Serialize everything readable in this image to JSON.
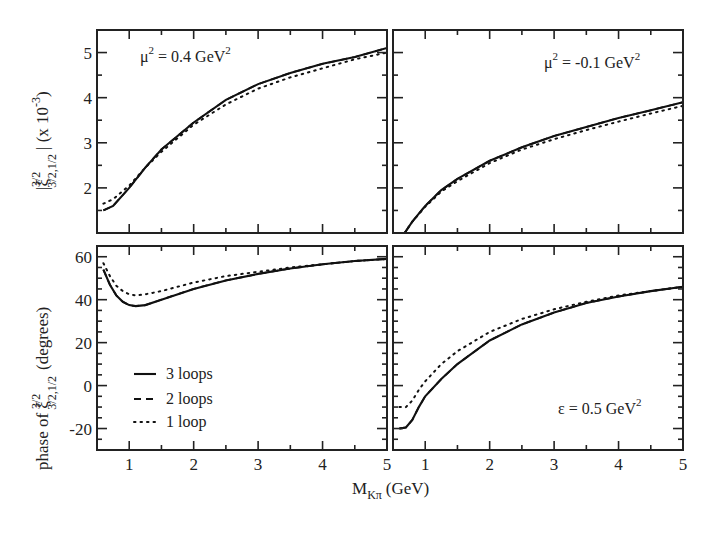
{
  "chart_data": {
    "type": "line",
    "xlabel": "M_Kπ (GeV)",
    "shared_x_ticks": [
      1,
      2,
      3,
      4,
      5
    ],
    "xlim": [
      0.5,
      5.0
    ],
    "legend": {
      "position": "lower-left of bottom-left panel",
      "entries": [
        "3 loops",
        "2 loops",
        "1 loop"
      ],
      "styles": [
        "solid",
        "dashed",
        "dotted"
      ]
    },
    "panels": [
      {
        "id": "top-left",
        "annotation": "μ² = 0.4 GeV²",
        "ylabel": "|ξ^{3/2}_{3/2,1/2}|  (x 10^-3)",
        "ylim": [
          1.0,
          5.5
        ],
        "y_ticks": [
          2,
          3,
          4,
          5
        ],
        "series": [
          {
            "name": "3 loops",
            "x": [
              0.6,
              0.75,
              1.0,
              1.25,
              1.5,
              2.0,
              2.5,
              3.0,
              3.5,
              4.0,
              4.5,
              5.0
            ],
            "values": [
              1.5,
              1.6,
              2.0,
              2.45,
              2.85,
              3.45,
              3.95,
              4.3,
              4.55,
              4.75,
              4.9,
              5.1
            ]
          },
          {
            "name": "2 loops",
            "x": [
              0.6,
              0.75,
              1.0,
              1.25,
              1.5,
              2.0,
              2.5,
              3.0,
              3.5,
              4.0,
              4.5,
              5.0
            ],
            "values": [
              1.5,
              1.6,
              2.0,
              2.45,
              2.85,
              3.45,
              3.95,
              4.3,
              4.55,
              4.75,
              4.9,
              5.1
            ]
          },
          {
            "name": "1 loop",
            "x": [
              0.6,
              0.75,
              1.0,
              1.25,
              1.5,
              2.0,
              2.5,
              3.0,
              3.5,
              4.0,
              4.5,
              5.0
            ],
            "values": [
              1.65,
              1.75,
              2.05,
              2.45,
              2.8,
              3.4,
              3.85,
              4.2,
              4.45,
              4.65,
              4.85,
              5.0
            ]
          }
        ]
      },
      {
        "id": "top-right",
        "annotation": "μ² = -0.1 GeV²",
        "ylim": [
          1.0,
          5.5
        ],
        "y_ticks": [
          2,
          3,
          4,
          5
        ],
        "series": [
          {
            "name": "3 loops",
            "x": [
              0.68,
              0.8,
              1.0,
              1.25,
              1.5,
              2.0,
              2.5,
              3.0,
              3.5,
              4.0,
              4.5,
              5.0
            ],
            "values": [
              1.0,
              1.25,
              1.6,
              1.95,
              2.2,
              2.6,
              2.9,
              3.15,
              3.35,
              3.55,
              3.72,
              3.9
            ]
          },
          {
            "name": "2 loops",
            "x": [
              0.68,
              0.8,
              1.0,
              1.25,
              1.5,
              2.0,
              2.5,
              3.0,
              3.5,
              4.0,
              4.5,
              5.0
            ],
            "values": [
              1.0,
              1.25,
              1.6,
              1.95,
              2.2,
              2.6,
              2.9,
              3.15,
              3.35,
              3.55,
              3.72,
              3.9
            ]
          },
          {
            "name": "1 loop",
            "x": [
              0.68,
              0.8,
              1.0,
              1.25,
              1.5,
              2.0,
              2.5,
              3.0,
              3.5,
              4.0,
              4.5,
              5.0
            ],
            "values": [
              1.0,
              1.25,
              1.58,
              1.92,
              2.15,
              2.55,
              2.85,
              3.08,
              3.28,
              3.47,
              3.65,
              3.82
            ]
          }
        ]
      },
      {
        "id": "bottom-left",
        "ylabel": "phase of ξ^{3/2}_{3/2,1/2} (degrees)",
        "ylim": [
          -30,
          65
        ],
        "y_ticks": [
          -20,
          0,
          20,
          40,
          60
        ],
        "series": [
          {
            "name": "3 loops",
            "x": [
              0.6,
              0.7,
              0.8,
              0.9,
              1.0,
              1.1,
              1.25,
              1.5,
              2.0,
              2.5,
              3.0,
              3.5,
              4.0,
              4.5,
              5.0
            ],
            "values": [
              54,
              47,
              42,
              39,
              37.5,
              37,
              37.5,
              40,
              45,
              49,
              52,
              54.5,
              56.5,
              58,
              59
            ]
          },
          {
            "name": "2 loops",
            "x": [
              0.6,
              0.7,
              0.8,
              0.9,
              1.0,
              1.1,
              1.25,
              1.5,
              2.0,
              2.5,
              3.0,
              3.5,
              4.0,
              4.5,
              5.0
            ],
            "values": [
              54,
              47,
              42,
              39,
              37.5,
              37,
              37.5,
              40,
              45,
              49,
              52,
              54.5,
              56.5,
              58,
              59
            ]
          },
          {
            "name": "1 loop",
            "x": [
              0.6,
              0.7,
              0.8,
              0.9,
              1.0,
              1.1,
              1.25,
              1.5,
              2.0,
              2.5,
              3.0,
              3.5,
              4.0,
              4.5,
              5.0
            ],
            "values": [
              57,
              51,
              46.5,
              44,
              42.5,
              42,
              42.5,
              44,
              48,
              51,
              53,
              55,
              56.5,
              58,
              59
            ]
          }
        ]
      },
      {
        "id": "bottom-right",
        "annotation": "ε = 0.5 GeV²",
        "ylim": [
          -30,
          65
        ],
        "y_ticks": [
          -20,
          0,
          20,
          40,
          60
        ],
        "series": [
          {
            "name": "3 loops",
            "x": [
              0.6,
              0.7,
              0.8,
              0.9,
              1.0,
              1.25,
              1.5,
              2.0,
              2.5,
              3.0,
              3.5,
              4.0,
              4.5,
              5.0
            ],
            "values": [
              -20,
              -19.5,
              -16,
              -10,
              -5,
              3,
              10,
              21,
              28.5,
              34,
              38.5,
              41.5,
              44,
              46
            ]
          },
          {
            "name": "2 loops",
            "x": [
              0.6,
              0.7,
              0.8,
              0.9,
              1.0,
              1.25,
              1.5,
              2.0,
              2.5,
              3.0,
              3.5,
              4.0,
              4.5,
              5.0
            ],
            "values": [
              -20,
              -19.5,
              -16,
              -10,
              -5,
              3,
              10,
              21,
              28.5,
              34,
              38.5,
              41.5,
              44,
              46
            ]
          },
          {
            "name": "1 loop",
            "x": [
              0.6,
              0.7,
              0.8,
              0.9,
              1.0,
              1.25,
              1.5,
              2.0,
              2.5,
              3.0,
              3.5,
              4.0,
              4.5,
              5.0
            ],
            "values": [
              -10,
              -10,
              -7,
              -2,
              2,
              10,
              16,
              25,
              31,
              35.5,
              39,
              42,
              44,
              46
            ]
          }
        ]
      }
    ]
  },
  "labels": {
    "x_axis": "M",
    "x_axis_sub": "Kπ",
    "x_axis_unit": "(GeV)",
    "y_top_main": "|ξ",
    "y_top_sup": "3/2",
    "y_top_sub": "3/2,1/2",
    "y_top_tail": "|   (x 10",
    "y_top_exp": "-3",
    "y_top_close": ")",
    "y_bottom_pre": "phase of ξ",
    "y_bottom_sup": "3/2",
    "y_bottom_sub": "3/2,1/2",
    "y_bottom_post": "(degrees)",
    "ann_tl": "μ",
    "ann_tl_rest": " = 0.4 GeV",
    "ann_tr": "μ",
    "ann_tr_rest": " = -0.1 GeV",
    "ann_br": "ε = 0.5 GeV",
    "sq": "2",
    "legend_1": "3 loops",
    "legend_2": "2 loops",
    "legend_3": "1 loop"
  }
}
